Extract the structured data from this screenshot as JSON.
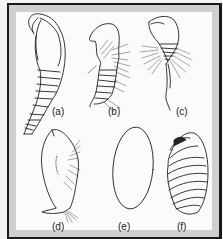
{
  "figure": {
    "panels": [
      {
        "id": "a",
        "label": "(a)"
      },
      {
        "id": "b",
        "label": "(b)"
      },
      {
        "id": "c",
        "label": "(c)"
      },
      {
        "id": "d",
        "label": "(d)"
      },
      {
        "id": "e",
        "label": "(e)"
      },
      {
        "id": "f",
        "label": "(f)"
      }
    ],
    "colors": {
      "frame": "#1a1a1a",
      "margin": "#cfcfcf",
      "background": "#fbfbfb",
      "ink": "#222222"
    }
  }
}
